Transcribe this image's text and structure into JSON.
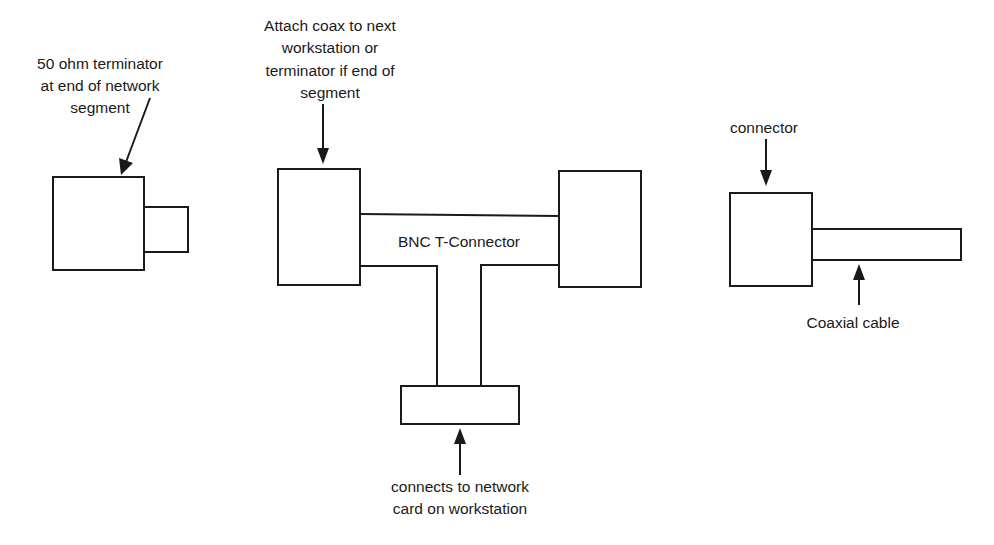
{
  "diagram": {
    "title": "BNC T-Connector",
    "colors": {
      "stroke": "#1a1a1a",
      "background": "#ffffff"
    },
    "terminator": {
      "label_lines": [
        "50 ohm terminator",
        "at end of network",
        "segment"
      ]
    },
    "t_connector": {
      "center_label": "BNC T-Connector",
      "top_label_lines": [
        "Attach coax to next",
        "workstation or",
        "terminator if end of",
        "segment"
      ],
      "bottom_label_lines": [
        "connects to network",
        "card on workstation"
      ]
    },
    "cable_end": {
      "connector_label": "connector",
      "cable_label": "Coaxial cable"
    }
  }
}
